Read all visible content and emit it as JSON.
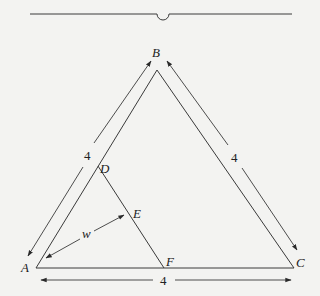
{
  "diagram": {
    "type": "geometry-figure",
    "vertices": {
      "A": {
        "label": "A",
        "x": 36,
        "y": 268
      },
      "B": {
        "label": "B",
        "x": 157,
        "y": 70
      },
      "C": {
        "label": "C",
        "x": 294,
        "y": 268
      },
      "D": {
        "label": "D",
        "x": 98,
        "y": 168
      },
      "E": {
        "label": "E",
        "x": 132,
        "y": 212
      },
      "F": {
        "label": "F",
        "x": 164,
        "y": 268
      }
    },
    "dimensions": [
      {
        "id": "AB",
        "label": "4"
      },
      {
        "id": "BC",
        "label": "4"
      },
      {
        "id": "AC",
        "label": "4"
      },
      {
        "id": "AE",
        "label": "w"
      }
    ],
    "top_rule": {
      "present": true,
      "note": "horizontal rule with small semicircle notch"
    }
  },
  "labels": {
    "A": "A",
    "B": "B",
    "C": "C",
    "D": "D",
    "E": "E",
    "F": "F",
    "side_ab": "4",
    "side_bc": "4",
    "side_ac": "4",
    "width_w": "w"
  }
}
